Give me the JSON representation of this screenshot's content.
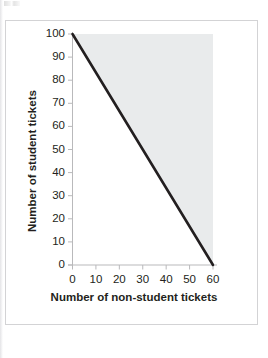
{
  "figure": {
    "frame_border_color": "#d3d3d5",
    "background_color": "#ffffff",
    "artifact_label": "scan-artifact"
  },
  "chart_data": {
    "type": "line",
    "title": "",
    "subtitle": "",
    "xlabel": "Number of non-student tickets",
    "ylabel": "Number of student tickets",
    "xlim": [
      0,
      60
    ],
    "ylim": [
      0,
      100
    ],
    "xticks": [
      0,
      10,
      20,
      30,
      40,
      50,
      60
    ],
    "xtick_labels": [
      "0",
      "10",
      "20",
      "30",
      "40",
      "50",
      "60"
    ],
    "yticks": [
      0,
      10,
      20,
      30,
      40,
      50,
      60,
      70,
      80,
      90,
      100
    ],
    "ytick_labels": [
      "0",
      "10",
      "20",
      "30",
      "40",
      "50",
      "60",
      "70",
      "80",
      "90",
      "100"
    ],
    "grid": false,
    "legend": null,
    "legend_position": "none",
    "series": [
      {
        "name": "budget constraint",
        "type": "line",
        "color": "#231f20",
        "line_width": 2.6,
        "x": [
          0,
          60
        ],
        "y": [
          100,
          0
        ],
        "points": [
          {
            "x": 0,
            "y": 100
          },
          {
            "x": 10,
            "y": 83
          },
          {
            "x": 20,
            "y": 67
          },
          {
            "x": 30,
            "y": 50
          },
          {
            "x": 40,
            "y": 33
          },
          {
            "x": 50,
            "y": 17
          },
          {
            "x": 60,
            "y": 0
          }
        ]
      }
    ],
    "shaded_regions": [
      {
        "name": "gray-shaded-region-above-line",
        "description": "light gray shading above the line, spanning x 0 to 60 and y from line up to 100",
        "color": "#e9ebec",
        "vertices": [
          {
            "x": 0,
            "y": 100
          },
          {
            "x": 60,
            "y": 100
          },
          {
            "x": 60,
            "y": 0
          }
        ]
      }
    ],
    "annotations": [],
    "axis_color": "#b9b9bb",
    "tick_color": "#b9b9bb",
    "text_color": "#231f20"
  }
}
